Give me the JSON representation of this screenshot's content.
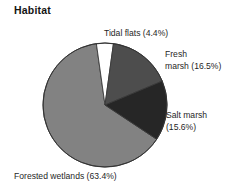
{
  "chart": {
    "title": "Habitat"
  },
  "chart_data": {
    "type": "pie",
    "title": "Habitat",
    "xlabel": "",
    "ylabel": "",
    "units": "percent",
    "legend_position": "none",
    "labels_position": "outside",
    "grid": false,
    "categories": [
      "Tidal flats",
      "Fresh marsh",
      "Salt marsh",
      "Forested wetlands"
    ],
    "values": [
      4.4,
      16.5,
      15.6,
      63.4
    ],
    "slices": [
      {
        "name": "Tidal flats",
        "value": 4.4,
        "value_text": "4.4%",
        "label": "Tidal flats (4.4%)",
        "color": "#ffffff",
        "start_angle_deg": -8.0,
        "sweep_deg": 15.84
      },
      {
        "name": "Fresh marsh",
        "value": 16.5,
        "value_text": "16.5%",
        "label": "Fresh marsh (16.5%)",
        "label_line_1": "Fresh",
        "label_line_2": "marsh (16.5%)",
        "color": "#4d4d4d",
        "start_angle_deg": 7.84,
        "sweep_deg": 59.4
      },
      {
        "name": "Salt marsh",
        "value": 15.6,
        "value_text": "15.6%",
        "label": "Salt marsh (15.6%)",
        "label_line_1": "Salt marsh",
        "label_line_2": "(15.6%)",
        "color": "#262626",
        "start_angle_deg": 67.24,
        "sweep_deg": 56.16
      },
      {
        "name": "Forested wetlands",
        "value": 63.4,
        "value_text": "63.4%",
        "label": "Forested wetlands (63.4%)",
        "color": "#828282",
        "start_angle_deg": 123.4,
        "sweep_deg": 228.24
      }
    ],
    "total": 99.9
  }
}
